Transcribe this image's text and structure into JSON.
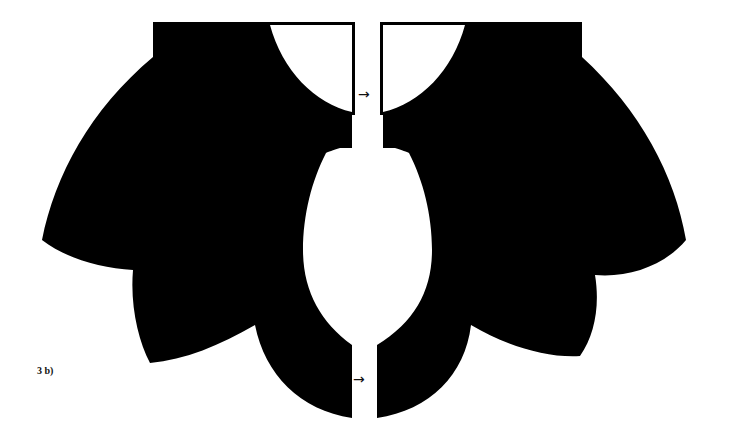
{
  "figure": {
    "label": "3 b)",
    "colors": {
      "fill": "#000000",
      "background": "#ffffff"
    },
    "pieces": [
      {
        "name": "left-collar-piece"
      },
      {
        "name": "right-collar-piece"
      }
    ],
    "arrows": [
      {
        "name": "grain-arrow-top",
        "glyph": "→"
      },
      {
        "name": "grain-arrow-bottom",
        "glyph": "→"
      }
    ]
  }
}
